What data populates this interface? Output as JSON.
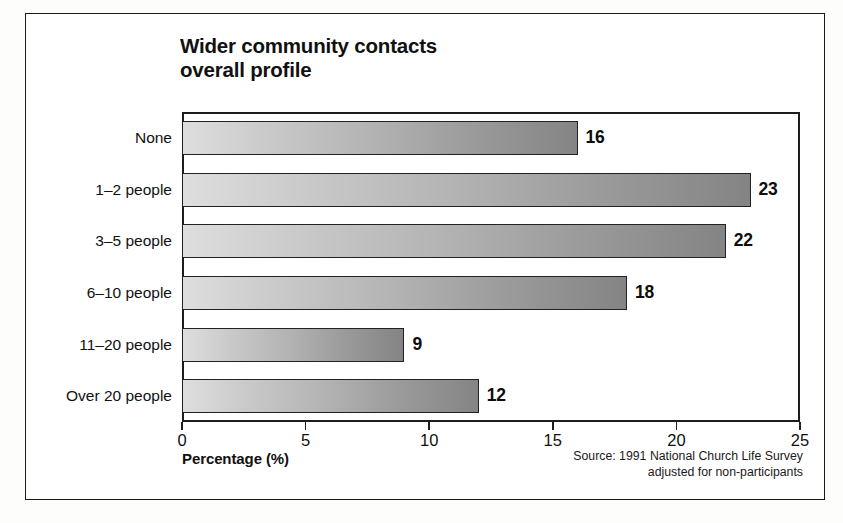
{
  "chart_data": {
    "type": "bar",
    "orientation": "horizontal",
    "title": "Wider community contacts\noverall profile",
    "categories": [
      "None",
      "1–2 people",
      "3–5 people",
      "6–10 people",
      "11–20 people",
      "Over 20 people"
    ],
    "values": [
      16,
      23,
      22,
      18,
      9,
      12
    ],
    "value_labels": [
      "16",
      "23",
      "22",
      "18",
      "9",
      "12"
    ],
    "xlabel": "Percentage (%)",
    "ylabel": "",
    "xlim": [
      0,
      25
    ],
    "xticks": [
      0,
      5,
      10,
      15,
      20,
      25
    ],
    "xticklabels": [
      "0",
      "5",
      "10",
      "15",
      "20",
      "25"
    ],
    "grid": false,
    "legend": null,
    "annotations": [
      "Source: 1991 National Church Life Survey",
      "adjusted for non-participants"
    ]
  },
  "source": {
    "line1": "Source: 1991 National Church Life Survey",
    "line2": "adjusted for non-participants"
  },
  "colors": {
    "bar_gradient_start": "#dedede",
    "bar_gradient_end": "#848484",
    "bar_border": "#222222",
    "axis": "#1d1d1d",
    "text": "#111111",
    "background": "#ffffff"
  }
}
